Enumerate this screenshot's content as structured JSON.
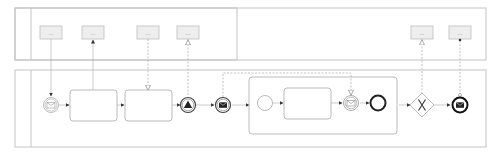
{
  "diagram": {
    "type": "BPMN collaboration",
    "colors": {
      "stroke": "#bdbdbd",
      "flow": "#999999",
      "dark": "#222222",
      "box_fill": "#eeeeee",
      "background": "#ffffff"
    },
    "top_pool": {
      "boxes": [
        {
          "label": "..."
        },
        {
          "label": "..."
        },
        {
          "label": "..."
        },
        {
          "label": "..."
        },
        {
          "label": "..."
        },
        {
          "label": "..."
        }
      ]
    },
    "bottom_pool": {
      "elements": [
        "message-start-event",
        "task",
        "task",
        "signal-intermediate-throw-event",
        "message-intermediate-throw-event",
        "subprocess",
        "exclusive-gateway",
        "message-end-event"
      ],
      "subprocess": {
        "elements": [
          "start-event",
          "task",
          "message-intermediate-catch-event",
          "end-event"
        ]
      }
    }
  }
}
